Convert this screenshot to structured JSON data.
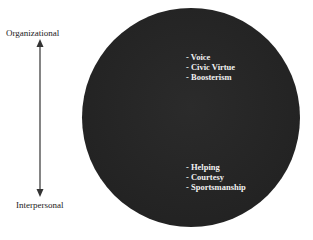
{
  "axis": {
    "top_label": "Organizational",
    "bottom_label": "Interpersonal",
    "arrow": "double-headed-vertical-arrow"
  },
  "circle": {
    "fill_color": "#232323",
    "text_color": "#f2f2f2"
  },
  "groups": {
    "organizational": {
      "items": [
        "- Voice",
        "- Civic Virtue",
        "- Boosterism"
      ]
    },
    "interpersonal": {
      "items": [
        "- Helping",
        "- Courtesy",
        "- Sportsmanship"
      ]
    }
  }
}
